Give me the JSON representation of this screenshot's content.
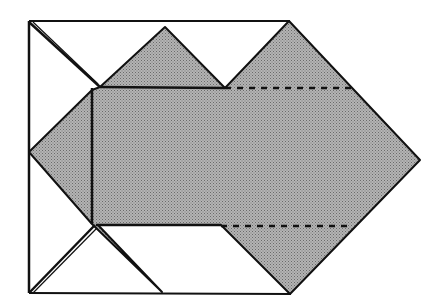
{
  "diagram": {
    "title": "Origami fold diagram",
    "colors": {
      "background": "#ffffff",
      "paper_shaded": "#a9a9a9",
      "line": "#111111"
    },
    "outline_rect": {
      "x1": 29,
      "y1": 21,
      "x2": 290,
      "y2": 293
    },
    "shaded_polygon": [
      [
        29,
        152
      ],
      [
        92,
        90
      ],
      [
        100,
        87
      ],
      [
        165,
        27
      ],
      [
        225,
        88
      ],
      [
        289,
        21
      ],
      [
        420,
        160
      ],
      [
        290,
        294
      ],
      [
        221,
        225
      ],
      [
        98,
        224
      ],
      [
        162,
        292
      ],
      [
        92,
        224
      ]
    ],
    "fold_lines": {
      "solid": [
        [
          [
            29,
            22
          ],
          [
            100,
            87
          ]
        ],
        [
          [
            29,
            293
          ],
          [
            95,
            224
          ]
        ],
        [
          [
            92,
            88
          ],
          [
            92,
            224
          ]
        ],
        [
          [
            100,
            87
          ],
          [
            225,
            88
          ]
        ],
        [
          [
            96,
            225
          ],
          [
            221,
            225
          ]
        ]
      ],
      "dashed": [
        [
          [
            225,
            88
          ],
          [
            352,
            88
          ]
        ],
        [
          [
            221,
            226
          ],
          [
            352,
            226
          ]
        ]
      ]
    },
    "caption": ""
  }
}
